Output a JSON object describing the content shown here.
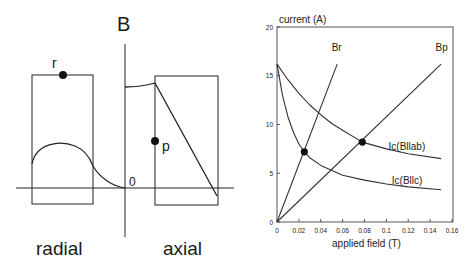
{
  "diagram": {
    "axis_label_B": "B",
    "origin_label": "0",
    "point_r_label": "r",
    "point_p_label": "p",
    "radial_label": "radial",
    "axial_label": "axial"
  },
  "chart_data": {
    "type": "line",
    "title": "",
    "ylabel": "current (A)",
    "xlabel": "applied field (T)",
    "xlim": [
      0,
      0.16
    ],
    "ylim": [
      0,
      20
    ],
    "x_ticks": [
      "0",
      "0.02",
      "0.04",
      "0.06",
      "0.08",
      "0.1",
      "0.12",
      "0.14",
      "0.16"
    ],
    "y_ticks": [
      "0",
      "5",
      "10",
      "15",
      "20"
    ],
    "grid": false,
    "series": [
      {
        "name": "Br",
        "x": [
          0,
          0.055
        ],
        "values": [
          0,
          16.2
        ]
      },
      {
        "name": "Bp",
        "x": [
          0,
          0.15
        ],
        "values": [
          0,
          16.2
        ]
      },
      {
        "name": "Ic(Bllab)",
        "x": [
          0,
          0.01,
          0.02,
          0.03,
          0.04,
          0.05,
          0.06,
          0.078,
          0.1,
          0.12,
          0.15
        ],
        "values": [
          16.2,
          14.6,
          13.2,
          12.0,
          11.0,
          10.1,
          9.4,
          8.2,
          7.5,
          7.0,
          6.5
        ]
      },
      {
        "name": "Ic(Bllc)",
        "x": [
          0,
          0.005,
          0.01,
          0.015,
          0.02,
          0.025,
          0.03,
          0.04,
          0.06,
          0.08,
          0.1,
          0.12,
          0.15
        ],
        "values": [
          16.2,
          13.0,
          10.8,
          9.2,
          8.0,
          7.2,
          6.6,
          5.8,
          4.8,
          4.3,
          3.9,
          3.6,
          3.3
        ]
      }
    ],
    "markers": [
      {
        "label": "Br intersection",
        "x": 0.025,
        "y": 7.2
      },
      {
        "label": "Bp intersection",
        "x": 0.078,
        "y": 8.2
      }
    ],
    "annotations": [
      "Br",
      "Bp",
      "Ic(Bllab)",
      "Ic(Bllc)"
    ]
  }
}
